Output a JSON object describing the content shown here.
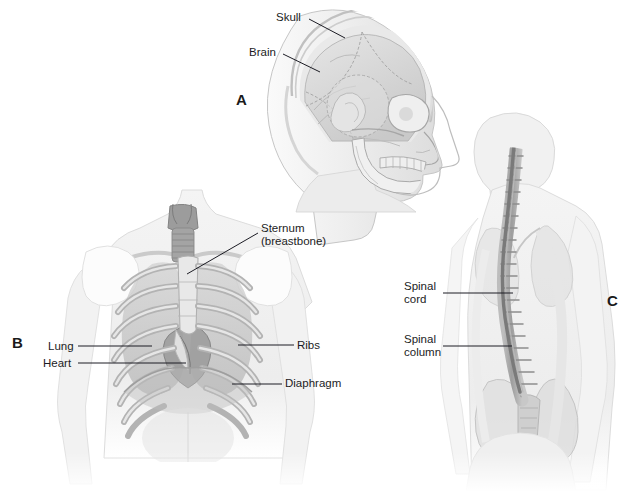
{
  "figure": {
    "background_color": "#ffffff",
    "ink_color": "#1c1c24",
    "tone_light": "#f2f2f2",
    "tone_mid": "#d8d8d8",
    "tone_dark": "#a8a8a8",
    "tone_deepest": "#808080"
  },
  "panels": [
    {
      "letter": "A",
      "name": "head-skull-brain",
      "caption_subject": "Lateral view of the head showing skull and brain"
    },
    {
      "letter": "B",
      "name": "chest-thorax",
      "caption_subject": "Anterior view of the chest showing rib cage, lungs, heart and diaphragm"
    },
    {
      "letter": "C",
      "name": "back-spine",
      "caption_subject": "Posterior view of the torso showing the spinal column and spinal cord"
    }
  ],
  "labels": {
    "skull": "Skull",
    "brain": "Brain",
    "sternum": "Sternum\n(breastbone)",
    "lung": "Lung",
    "heart": "Heart",
    "ribs": "Ribs",
    "diaphragm": "Diaphragm",
    "spinal_cord": "Spinal\ncord",
    "spinal_column": "Spinal\ncolumn"
  }
}
